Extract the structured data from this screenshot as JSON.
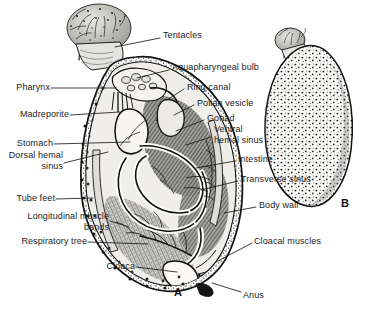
{
  "figure": {
    "background_color": "#ffffff",
    "ink_color": "#1c1c1c",
    "panel_marks": [
      {
        "name": "panel-a-mark",
        "text": "A",
        "x": 174,
        "y": 286
      },
      {
        "name": "panel-b-mark",
        "text": "B",
        "x": 341,
        "y": 197
      }
    ],
    "labels": [
      {
        "name": "tentacles",
        "text": "Tentacles",
        "x": 163,
        "y": 35,
        "align": "left"
      },
      {
        "name": "aquapharyngeal-bulb",
        "text": "Aquapharyngeal bulb",
        "x": 172,
        "y": 67,
        "align": "left"
      },
      {
        "name": "ring-canal",
        "text": "Ring canal",
        "x": 187,
        "y": 86,
        "align": "left"
      },
      {
        "name": "polian-vesicle",
        "text": "Polian vesicle",
        "x": 197,
        "y": 102,
        "align": "left"
      },
      {
        "name": "gonad",
        "text": "Gonad",
        "x": 207,
        "y": 117,
        "align": "left"
      },
      {
        "name": "ventral-hemal-sinus",
        "text": "Ventral\nhemal sinus",
        "x": 214,
        "y": 129,
        "align": "left"
      },
      {
        "name": "intestine",
        "text": "Intestine",
        "x": 238,
        "y": 158,
        "align": "left"
      },
      {
        "name": "transverse-sinus",
        "text": "Transverse sinus",
        "x": 241,
        "y": 178,
        "align": "left"
      },
      {
        "name": "body-wall",
        "text": "Body wall",
        "x": 259,
        "y": 204,
        "align": "left"
      },
      {
        "name": "cloacal-muscles",
        "text": "Cloacal muscles",
        "x": 254,
        "y": 240,
        "align": "left"
      },
      {
        "name": "anus",
        "text": "Anus",
        "x": 243,
        "y": 294,
        "align": "left"
      },
      {
        "name": "pharynx",
        "text": "Pharynx",
        "x": 14,
        "y": 85,
        "align": "right",
        "right": 300
      },
      {
        "name": "madreporite",
        "text": "Madreporite",
        "x": 14,
        "y": 112,
        "align": "right",
        "right": 300
      },
      {
        "name": "stomach",
        "text": "Stomach",
        "x": 14,
        "y": 141,
        "align": "right",
        "right": 300
      },
      {
        "name": "dorsal-hemal-sinus",
        "text": "Dorsal hemal\nsinus",
        "x": 14,
        "y": 152,
        "align": "right",
        "right": 300
      },
      {
        "name": "tube-feet",
        "text": "Tube feet",
        "x": 14,
        "y": 196,
        "align": "right",
        "right": 300
      },
      {
        "name": "longitudinal-muscle-bands",
        "text": "Longitudinal muscle\nbands",
        "x": 8,
        "y": 214,
        "align": "right",
        "right": 300
      },
      {
        "name": "respiratory-tree",
        "text": "Respiratory tree",
        "x": 14,
        "y": 239,
        "align": "right",
        "right": 300
      },
      {
        "name": "cloaca",
        "text": "Cloaca",
        "x": 108,
        "y": 264,
        "align": "right",
        "right": 300
      }
    ]
  }
}
